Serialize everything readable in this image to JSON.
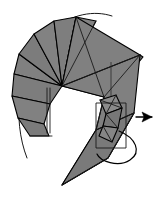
{
  "figure": {
    "type": "origami-fold-diagram",
    "canvas": {
      "width": 163,
      "height": 204,
      "background": "#ffffff"
    },
    "colors": {
      "paper_fill": "#808080",
      "paper_fill_shadow": "#6e6e6e",
      "paper_fill_light": "#8c8c8c",
      "crease_line": "#1a1a1a",
      "outline": "#000000",
      "arrow": "#000000",
      "background": "#ffffff"
    },
    "stroke_widths": {
      "outline": 1.1,
      "crease": 0.9,
      "motion_arc": 1.0,
      "arrow": 1.2
    }
  },
  "shapes": {
    "fan_panels": {
      "name": "radial-fan-panels",
      "pivot": [
        62,
        86
      ],
      "description": "Fan of triangular paper panels radiating from the central pivot point",
      "polygons": [
        {
          "id": "fan-1",
          "tone": "#808080",
          "points": "62,86 14,74 19,54 62,86"
        },
        {
          "id": "fan-2",
          "tone": "#7c7c7c",
          "points": "62,86 19,54 34,34 62,86"
        },
        {
          "id": "fan-3",
          "tone": "#828282",
          "points": "62,86 34,34 54,21 62,86"
        },
        {
          "id": "fan-4",
          "tone": "#7e7e7e",
          "points": "62,86 54,21 76,17 62,86"
        },
        {
          "id": "fan-5",
          "tone": "#838383",
          "points": "62,86 76,17 96,21 62,86"
        },
        {
          "id": "fan-6",
          "tone": "#7d7d7d",
          "points": "62,86 14,74 12,96 50,104 62,86"
        },
        {
          "id": "fan-7",
          "tone": "#818181",
          "points": "50,104 12,96 18,118 44,124 50,104"
        },
        {
          "id": "fan-8",
          "tone": "#7b7b7b",
          "points": "44,124 18,118 30,136 49,136 44,124"
        }
      ]
    },
    "upper_wing": {
      "name": "upper-wing-panel",
      "polygons": [
        {
          "id": "wing-main",
          "tone": "#808080",
          "points": "62,86 76,17 140,55 104,97"
        },
        {
          "id": "wing-edge",
          "tone": "#6b6b6b",
          "points": "140,55 143,57 108,100 104,97"
        }
      ],
      "creases": [
        "62,86 140,55",
        "76,17 104,97",
        "96,21 62,86",
        "104,97 140,55"
      ]
    },
    "lower_body": {
      "name": "lower-body-panel",
      "polygons": [
        {
          "id": "body-main",
          "tone": "#808080",
          "points": "62,86 104,97 96,130 62,185 108,158 134,113 140,55"
        },
        {
          "id": "body-spike",
          "tone": "#7a7a7a",
          "points": "62,185 96,130 134,113 108,158"
        }
      ],
      "creases": [
        "104,97 96,130",
        "96,130 134,113",
        "108,158 134,113",
        "62,185 108,158"
      ]
    },
    "small_flap": {
      "name": "small-folded-flap",
      "polygons": [
        {
          "id": "flap-top",
          "tone": "#8a8a8a",
          "points": "100,100 116,95 122,108 106,114"
        },
        {
          "id": "flap-mid",
          "tone": "#777777",
          "points": "106,114 122,108 118,128 103,126"
        },
        {
          "id": "flap-low",
          "tone": "#858585",
          "points": "103,126 118,128 112,142 99,136"
        }
      ],
      "creases": [
        "100,100 122,108",
        "106,114 118,128",
        "103,126 112,142",
        "116,95 106,114"
      ]
    },
    "guide_rect": {
      "name": "alignment-guide-rectangle",
      "points": "96,103 126,103 126,148 96,148"
    },
    "left_guide_lines": {
      "name": "left-edge-guide-lines",
      "lines": [
        "47,88 47,133",
        "50,88 50,133",
        "30,136 52,136"
      ]
    },
    "vertical_guide": {
      "name": "upper-vertical-guide-line",
      "line": "111,62 111,100"
    }
  },
  "arrows": {
    "motion_arc": {
      "name": "rotation-motion-arc",
      "label": "rotate/swing arc",
      "path": "M 27,158 C 12,120 16,60 52,30 C 72,14 94,10 112,16"
    },
    "straight_arrow": {
      "name": "pull-direction-arrow",
      "label": "pull in direction",
      "shaft": "M 136,117 L 152,117",
      "head": "152,117 142,112 144,117 142,122"
    },
    "curl_arrow": {
      "name": "tuck-curl-arrow",
      "label": "tuck inside / curl under",
      "path": "M 119,131 C 136,138 142,152 130,160 C 118,168 100,161 97,154"
    }
  },
  "annotations": {
    "step_number": "",
    "caption": ""
  }
}
